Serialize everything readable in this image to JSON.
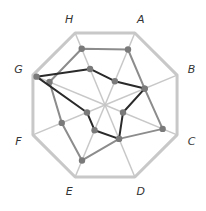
{
  "chart_data": {
    "type": "radar",
    "title": "",
    "axes": [
      "A",
      "B",
      "C",
      "D",
      "E",
      "F",
      "G",
      "H"
    ],
    "range": [
      0,
      1
    ],
    "grid": true,
    "series": [
      {
        "name": "series-1",
        "color": "#8c8c8c",
        "values": [
          0.77,
          0.55,
          0.8,
          0.47,
          0.77,
          0.6,
          0.77,
          0.78
        ]
      },
      {
        "name": "series-2",
        "color": "#2a2a2a",
        "values": [
          0.33,
          0.55,
          0.25,
          0.47,
          0.35,
          0.25,
          0.95,
          0.5
        ]
      }
    ],
    "colors": {
      "frame": "#c8c8c8",
      "spoke": "#c8c8c8",
      "point": "#7a7a7a"
    }
  }
}
